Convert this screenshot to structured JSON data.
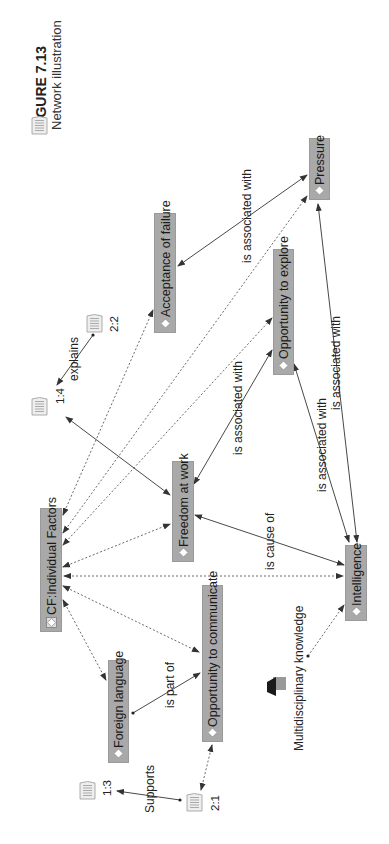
{
  "caption": {
    "figure_label": "FIGURE 7.13",
    "title": "Network illustration"
  },
  "colors": {
    "node_fill": "#a9a9a9",
    "edge": "#333333",
    "text": "#1a1a1a"
  },
  "nodes": {
    "pressure": {
      "label": "Pressure",
      "icon": "code-diamond-icon"
    },
    "acceptance_of_failure": {
      "label": "Acceptance of failure",
      "icon": "code-diamond-icon"
    },
    "opportunity_to_explore": {
      "label": "Opportunity to explore",
      "icon": "code-diamond-icon"
    },
    "freedom_at_work": {
      "label": "Freedom at work",
      "icon": "code-diamond-icon"
    },
    "cf_individual_factors": {
      "label": "CF:Individual Factors",
      "icon": "code-family-icon"
    },
    "intelligence": {
      "label": "Intelligence",
      "icon": "code-diamond-icon"
    },
    "opportunity_to_communicate": {
      "label": "Opportunity to communicate",
      "icon": "code-diamond-icon"
    },
    "foreign_language": {
      "label": "Foreign language",
      "icon": "code-diamond-icon"
    }
  },
  "quotations": {
    "q1_4": {
      "label": "1:4",
      "icon": "quotation-document-icon"
    },
    "q2_2": {
      "label": "2:2",
      "icon": "quotation-document-icon"
    },
    "q1_3": {
      "label": "1:3",
      "icon": "quotation-document-icon"
    },
    "q2_1": {
      "label": "2:1",
      "icon": "quotation-document-icon"
    }
  },
  "memo": {
    "label": "Multidisciplinary knowledge",
    "icon": "memo-icon"
  },
  "edge_labels": {
    "acceptance_pressure": "is associated with",
    "explains": "explains",
    "freedom_explore": "is associated with",
    "explore_intelligence": "is associated with",
    "pressure_intelligence": "is associated with",
    "freedom_intelligence": "is cause of",
    "foreign_communicate": "is part of",
    "supports": "Supports"
  },
  "edges": [
    {
      "from": "Acceptance of failure",
      "to": "Pressure",
      "label": "is associated with",
      "style": "solid"
    },
    {
      "from": "Pressure",
      "to": "Intelligence",
      "label": "is associated with",
      "style": "solid"
    },
    {
      "from": "Opportunity to explore",
      "to": "Intelligence",
      "label": "is associated with",
      "style": "solid"
    },
    {
      "from": "Freedom at work",
      "to": "Opportunity to explore",
      "label": "is associated with",
      "style": "solid"
    },
    {
      "from": "Freedom at work",
      "to": "Intelligence",
      "label": "is cause of",
      "style": "solid"
    },
    {
      "from": "2:2",
      "to": "1:4",
      "label": "explains",
      "style": "solid"
    },
    {
      "from": "1:4",
      "to": "Freedom at work",
      "label": "",
      "style": "solid"
    },
    {
      "from": "Foreign language",
      "to": "Opportunity to communicate",
      "label": "is part of",
      "style": "solid"
    },
    {
      "from": "2:1",
      "to": "1:3",
      "label": "Supports",
      "style": "solid"
    },
    {
      "from": "CF:Individual Factors",
      "to": "Acceptance of failure",
      "label": "",
      "style": "dotted"
    },
    {
      "from": "CF:Individual Factors",
      "to": "Pressure",
      "label": "",
      "style": "dotted"
    },
    {
      "from": "CF:Individual Factors",
      "to": "Opportunity to explore",
      "label": "",
      "style": "dotted"
    },
    {
      "from": "CF:Individual Factors",
      "to": "Freedom at work",
      "label": "",
      "style": "dotted"
    },
    {
      "from": "CF:Individual Factors",
      "to": "Intelligence",
      "label": "",
      "style": "dotted"
    },
    {
      "from": "CF:Individual Factors",
      "to": "Opportunity to communicate",
      "label": "",
      "style": "dotted"
    },
    {
      "from": "CF:Individual Factors",
      "to": "Foreign language",
      "label": "",
      "style": "dotted"
    },
    {
      "from": "Opportunity to communicate",
      "to": "2:1",
      "label": "",
      "style": "dotted"
    },
    {
      "from": "Multidisciplinary knowledge",
      "to": "Intelligence",
      "label": "",
      "style": "dotted"
    }
  ]
}
